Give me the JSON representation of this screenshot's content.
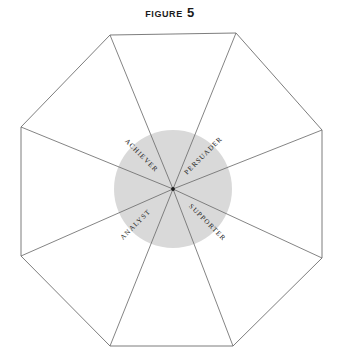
{
  "figure": {
    "title": "Figure 5",
    "background_color": "#ffffff",
    "line_color": "#6e6e6e",
    "label_color": "#1d1d1d",
    "title_color": "#1b1b1b"
  },
  "circle": {
    "name": "center-circle",
    "fill_color": "#d9d9d9",
    "center_x": 173,
    "center_y": 189,
    "radius": 59
  },
  "octagon": {
    "name": "octagon-outline",
    "stroke_color": "#6e6e6e",
    "vertices": [
      {
        "x": 110,
        "y": 35
      },
      {
        "x": 236,
        "y": 33
      },
      {
        "x": 322,
        "y": 130
      },
      {
        "x": 322,
        "y": 258
      },
      {
        "x": 233,
        "y": 346
      },
      {
        "x": 110,
        "y": 346
      },
      {
        "x": 21,
        "y": 256
      },
      {
        "x": 21,
        "y": 127
      }
    ]
  },
  "center_point": {
    "name": "center-node",
    "x": 173,
    "y": 189
  },
  "labels": [
    {
      "text": "Achiever",
      "name": "wedge-label-achiever",
      "x": 140,
      "y": 157,
      "rotation": 45
    },
    {
      "text": "Persuader",
      "name": "wedge-label-persuader",
      "x": 205,
      "y": 157,
      "rotation": -45
    },
    {
      "text": "Analyst",
      "name": "wedge-label-analyst",
      "x": 137,
      "y": 226,
      "rotation": -45
    },
    {
      "text": "Supporter",
      "name": "wedge-label-supporter",
      "x": 206,
      "y": 224,
      "rotation": 45
    }
  ]
}
